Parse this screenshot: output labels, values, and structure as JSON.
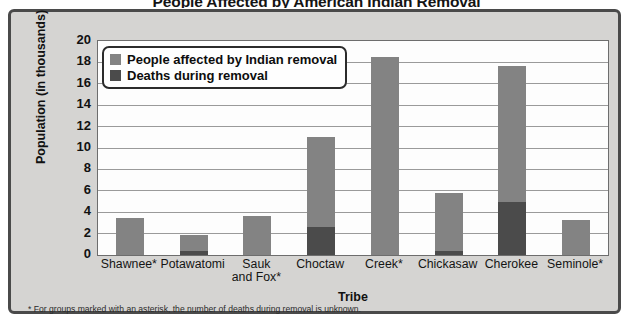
{
  "chart_data": {
    "type": "bar",
    "stacked": true,
    "title": "People Affected by American Indian Removal",
    "xlabel": "Tribe",
    "ylabel": "Population (in thousands)",
    "ylim": [
      0,
      20
    ],
    "yticks": [
      "0",
      "2",
      "4",
      "6",
      "8",
      "10",
      "12",
      "14",
      "16",
      "18",
      "20"
    ],
    "grid": true,
    "legend_position": "top-left-inside",
    "categories": [
      "Shawnee*",
      "Potawatomi",
      "Sauk\nand Fox*",
      "Choctaw",
      "Creek*",
      "Chickasaw",
      "Cherokee",
      "Seminole*"
    ],
    "series": [
      {
        "name": "People affected by Indian removal",
        "color": "#838383",
        "values": [
          3.5,
          1.9,
          3.6,
          11.0,
          18.5,
          5.8,
          17.7,
          3.3
        ]
      },
      {
        "name": "Deaths during removal",
        "color": "#4b4b4b",
        "values": [
          0,
          0.4,
          0,
          2.6,
          0,
          0.4,
          5.0,
          0
        ]
      }
    ],
    "footnote": "* For groups marked with an asterisk, the number of deaths during removal is unknown."
  },
  "labels": {
    "cat_0": "Shawnee*",
    "cat_1": "Potawatomi",
    "cat_2_line1": "Sauk",
    "cat_2_line2": "and Fox*",
    "cat_3": "Choctaw",
    "cat_4": "Creek*",
    "cat_5": "Chickasaw",
    "cat_6": "Cherokee",
    "cat_7": "Seminole*"
  },
  "yticks": {
    "t0": "0",
    "t1": "2",
    "t2": "4",
    "t3": "6",
    "t4": "8",
    "t5": "10",
    "t6": "12",
    "t7": "14",
    "t8": "16",
    "t9": "18",
    "t10": "20"
  },
  "legend": {
    "item_0": "People affected by Indian removal",
    "item_1": "Deaths during removal"
  },
  "colors": {
    "light_bar": "#838383",
    "dark_bar": "#4b4b4b",
    "panel_background": "#d5d4d2",
    "panel_border": "#4a4a4a",
    "plot_background": "#fdfdfd",
    "gridline": "#9a9a9a"
  }
}
